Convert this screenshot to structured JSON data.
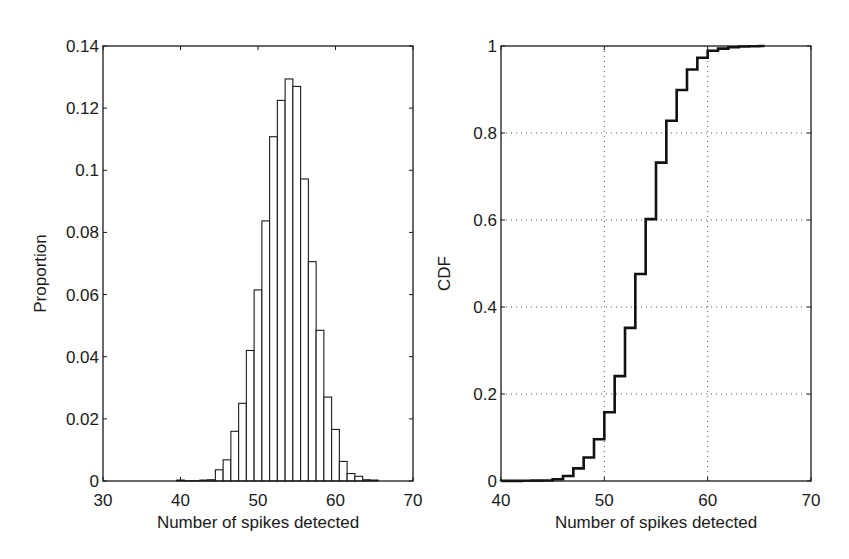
{
  "figure": {
    "background": "#ffffff",
    "line_color": "#1a1a1a",
    "grid_color": "#555555"
  },
  "chart_data": [
    {
      "type": "bar",
      "title": "",
      "xlabel": "Number of spikes detected",
      "ylabel": "Proportion",
      "xlim": [
        30,
        70
      ],
      "ylim": [
        0,
        0.14
      ],
      "xticks": [
        30,
        40,
        50,
        60,
        70
      ],
      "xtick_labels": [
        "30",
        "40",
        "50",
        "60",
        "70"
      ],
      "yticks": [
        0,
        0.02,
        0.04,
        0.06,
        0.08,
        0.1,
        0.12,
        0.14
      ],
      "ytick_labels": [
        "0",
        "0.02",
        "0.04",
        "0.06",
        "0.08",
        "0.1",
        "0.12",
        "0.14"
      ],
      "grid": false,
      "legend": null,
      "bar_width": 1,
      "categories": [
        40,
        41,
        42,
        43,
        44,
        45,
        46,
        47,
        48,
        49,
        50,
        51,
        52,
        53,
        54,
        55,
        56,
        57,
        58,
        59,
        60,
        61,
        62,
        63,
        64,
        65
      ],
      "values": [
        0.0003,
        0.0001,
        0.0001,
        0.0003,
        0.0004,
        0.0036,
        0.0068,
        0.016,
        0.025,
        0.042,
        0.0615,
        0.0837,
        0.1108,
        0.1225,
        0.1294,
        0.127,
        0.0972,
        0.0706,
        0.0485,
        0.027,
        0.0166,
        0.0063,
        0.0024,
        0.0015,
        0.0004,
        0.0003
      ]
    },
    {
      "type": "line",
      "style": "step",
      "title": "",
      "xlabel": "Number of spikes detected",
      "ylabel": "CDF",
      "xlim": [
        40,
        70
      ],
      "ylim": [
        0,
        1
      ],
      "xticks": [
        40,
        50,
        60,
        70
      ],
      "xtick_labels": [
        "40",
        "50",
        "60",
        "70"
      ],
      "yticks": [
        0,
        0.2,
        0.4,
        0.6,
        0.8,
        1
      ],
      "ytick_labels": [
        "0",
        "0.2",
        "0.4",
        "0.6",
        "0.8",
        "1"
      ],
      "grid": true,
      "grid_style": "dotted",
      "legend": null,
      "x": [
        40,
        41,
        42,
        43,
        44,
        45,
        46,
        47,
        48,
        49,
        50,
        51,
        52,
        53,
        54,
        55,
        56,
        57,
        58,
        59,
        60,
        61,
        62,
        63,
        64,
        65
      ],
      "y": [
        0.0003,
        0.0004,
        0.0005,
        0.0008,
        0.0012,
        0.004,
        0.0115,
        0.029,
        0.054,
        0.096,
        0.158,
        0.241,
        0.352,
        0.476,
        0.602,
        0.732,
        0.828,
        0.899,
        0.946,
        0.973,
        0.989,
        0.994,
        0.997,
        0.999,
        0.9995,
        1.0
      ]
    }
  ]
}
